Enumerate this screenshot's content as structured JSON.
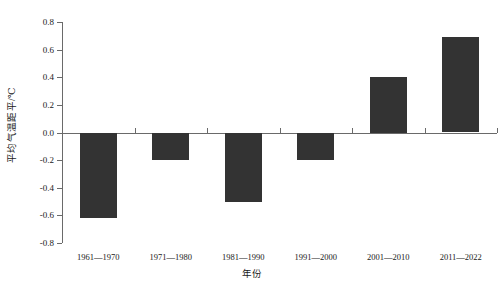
{
  "chart_data": {
    "type": "bar",
    "title": "",
    "subtitle": "",
    "xlabel": "年份",
    "ylabel": "平均气温距平/℃",
    "categories": [
      "1961—1970",
      "1971—1980",
      "1981—1990",
      "1991—2000",
      "2001—2010",
      "2011—2022"
    ],
    "values": [
      -0.62,
      -0.2,
      -0.5,
      -0.2,
      0.4,
      0.69
    ],
    "series": [
      {
        "name": "平均气温距平",
        "values": [
          -0.62,
          -0.2,
          -0.5,
          -0.2,
          0.4,
          0.69
        ]
      }
    ],
    "ylim": [
      -0.8,
      0.8
    ],
    "y_ticks": [
      0.8,
      0.6,
      0.4,
      0.2,
      0.0,
      -0.2,
      -0.4,
      -0.6,
      -0.8
    ],
    "y_tick_labels": [
      "0.8",
      "0.6",
      "0.4",
      "0.2",
      "0.0",
      "-0.2",
      "-0.4",
      "-0.6",
      "-0.8"
    ],
    "grid": false,
    "legend": null,
    "legend_position": "none",
    "bar_color": "#333333",
    "axis_color": "#6a6a6a",
    "background_color": "#ffffff",
    "annotations": []
  }
}
